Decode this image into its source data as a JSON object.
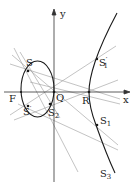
{
  "figure": {
    "colors": {
      "curve": "#1a1a1a",
      "axis": "#333333",
      "lines": "#9a9a9a",
      "background": "#ffffff"
    },
    "axes": {
      "x_label": "x",
      "y_label": "y"
    },
    "points": [
      {
        "id": "S",
        "label": "S",
        "sub": "",
        "prime": ""
      },
      {
        "id": "Sp",
        "label": "S",
        "sub": "",
        "prime": "′"
      },
      {
        "id": "F",
        "label": "F",
        "sub": "",
        "prime": ""
      },
      {
        "id": "Q",
        "label": "Q",
        "sub": "",
        "prime": ""
      },
      {
        "id": "S2",
        "label": "S",
        "sub": "2",
        "prime": ""
      },
      {
        "id": "R",
        "label": "R",
        "sub": "",
        "prime": ""
      },
      {
        "id": "S1p",
        "label": "S",
        "sub": "1",
        "prime": "′"
      },
      {
        "id": "S1",
        "label": "S",
        "sub": "1",
        "prime": ""
      },
      {
        "id": "S3",
        "label": "S",
        "sub": "3",
        "prime": ""
      }
    ]
  }
}
